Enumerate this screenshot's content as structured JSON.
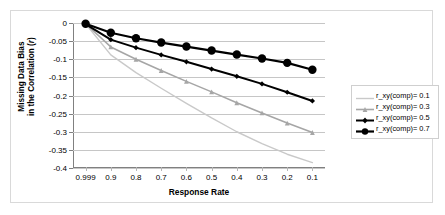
{
  "chart_data": {
    "type": "line",
    "title": "",
    "xlabel": "Response Rate",
    "ylabel": "Missing Data Bias in the Correlation (r)",
    "ylabel_line1": "Missing Data Bias",
    "ylabel_line2_prefix": "in the Correlation (",
    "ylabel_line2_italic": "r",
    "ylabel_line2_suffix": ")",
    "categories": [
      "0.999",
      "0.9",
      "0.8",
      "0.7",
      "0.6",
      "0.5",
      "0.4",
      "0.3",
      "0.2",
      "0.1"
    ],
    "x_tick_labels": [
      "0.999",
      "0.9",
      "0.8",
      "0.7",
      "0.6",
      "0.5",
      "0.4",
      "0.3",
      "0.2",
      "0.1"
    ],
    "y_tick_labels": [
      "0",
      "-0.05",
      "-0.1",
      "-0.15",
      "-0.2",
      "-0.25",
      "-0.3",
      "-0.35",
      "-0.4"
    ],
    "y_tick_values": [
      0,
      -0.05,
      -0.1,
      -0.15,
      -0.2,
      -0.25,
      -0.3,
      -0.35,
      -0.4
    ],
    "ylim": [
      -0.4,
      0
    ],
    "grid": true,
    "legend_position": "right",
    "series": [
      {
        "name": "r_xy(comp)= 0.1",
        "color": "#c9c9c9",
        "marker": "none",
        "values": [
          -0.002,
          -0.088,
          -0.137,
          -0.18,
          -0.222,
          -0.262,
          -0.3,
          -0.333,
          -0.362,
          -0.385
        ]
      },
      {
        "name": "r_xy(comp)= 0.3",
        "color": "#a6a6a6",
        "marker": "triangle",
        "values": [
          -0.002,
          -0.066,
          -0.1,
          -0.131,
          -0.161,
          -0.19,
          -0.22,
          -0.248,
          -0.276,
          -0.302
        ]
      },
      {
        "name": "r_xy(comp)= 0.5",
        "color": "#000000",
        "marker": "diamond",
        "values": [
          -0.003,
          -0.046,
          -0.068,
          -0.088,
          -0.107,
          -0.127,
          -0.147,
          -0.168,
          -0.191,
          -0.215
        ]
      },
      {
        "name": "r_xy(comp)= 0.7",
        "color": "#000000",
        "marker": "circle",
        "values": [
          -0.002,
          -0.027,
          -0.042,
          -0.054,
          -0.065,
          -0.076,
          -0.087,
          -0.098,
          -0.11,
          -0.129
        ]
      }
    ]
  }
}
